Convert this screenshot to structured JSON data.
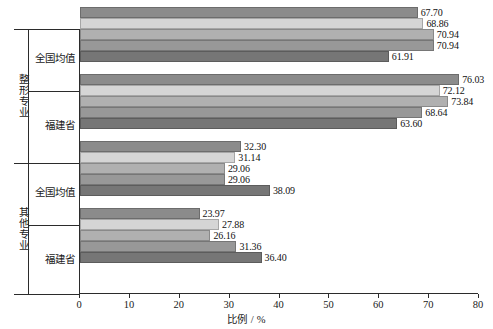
{
  "chart_data": {
    "type": "bar",
    "orientation": "horizontal",
    "title": "",
    "xlabel": "比例 / %",
    "ylabel": "",
    "xlim": [
      0,
      80
    ],
    "xticks": [
      0,
      10,
      20,
      30,
      40,
      50,
      60,
      70,
      80
    ],
    "grid": false,
    "legend_position": "top-center",
    "series": [
      {
        "name": "2018年",
        "color": "#8b8b8b",
        "values": [
          67.7,
          76.03,
          32.3,
          23.97
        ]
      },
      {
        "name": "2019年",
        "color": "#d5d5d5",
        "values": [
          68.86,
          72.12,
          31.14,
          27.88
        ]
      },
      {
        "name": "2020年",
        "color": "#b0b0b0",
        "values": [
          70.94,
          73.84,
          29.06,
          26.16
        ]
      },
      {
        "name": "2021年",
        "color": "#989898",
        "values": [
          70.94,
          68.64,
          29.06,
          31.36
        ]
      },
      {
        "name": "2022年",
        "color": "#767676",
        "values": [
          61.91,
          63.6,
          38.09,
          36.4
        ]
      }
    ],
    "categories": [
      "全国均值",
      "福建省",
      "全国均值",
      "福建省"
    ],
    "groups": [
      {
        "label": "整形专业",
        "categories": [
          "全国均值",
          "福建省"
        ]
      },
      {
        "label": "其他专业",
        "categories": [
          "全国均值",
          "福建省"
        ]
      }
    ],
    "value_label_format": "0.00"
  },
  "legend": {
    "items": [
      {
        "label": "2018年",
        "color": "#8b8b8b"
      },
      {
        "label": "2019年",
        "color": "#d5d5d5"
      },
      {
        "label": "2020年",
        "color": "#b0b0b0"
      },
      {
        "label": "2021年",
        "color": "#989898"
      },
      {
        "label": "2022年",
        "color": "#767676"
      }
    ]
  },
  "axis": {
    "x_title": "比例 / %",
    "x_tick_labels": [
      "0",
      "10",
      "20",
      "30",
      "40",
      "50",
      "60",
      "70",
      "80"
    ]
  },
  "y_axis": {
    "groups": [
      {
        "label": "整形专业",
        "categories": [
          "全国均值",
          "福建省"
        ]
      },
      {
        "label": "其他专业",
        "categories": [
          "全国均值",
          "福建省"
        ]
      }
    ]
  }
}
